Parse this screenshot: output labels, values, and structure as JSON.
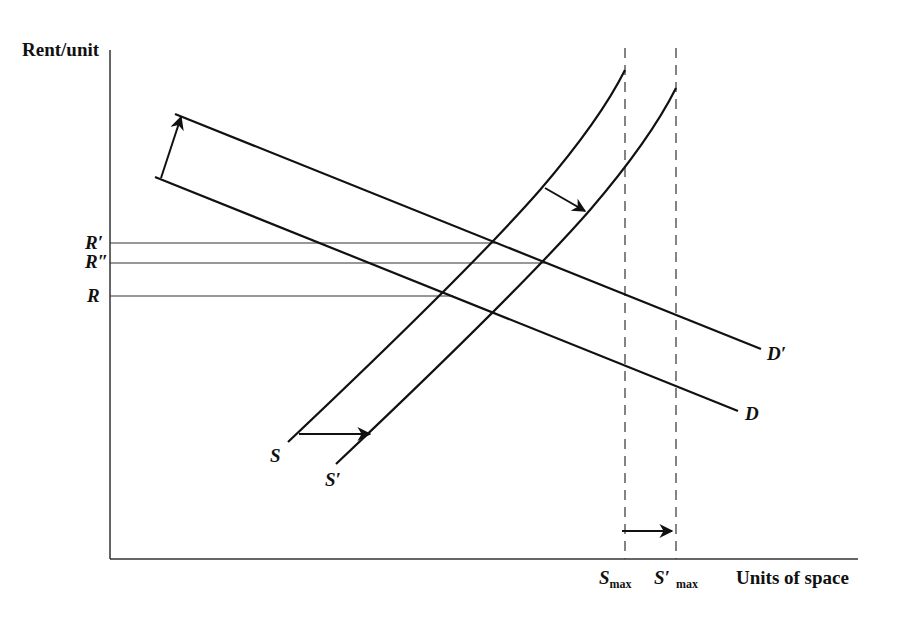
{
  "diagram": {
    "title": "",
    "y_axis_label": "Rent/unit",
    "x_axis_label": "Units of space",
    "rent_levels": [
      {
        "label": "R′",
        "y": 243,
        "x_end": 498
      },
      {
        "label": "R″",
        "y": 263,
        "x_end": 546
      },
      {
        "label": "R",
        "y": 296,
        "x_end": 453
      }
    ],
    "curves": {
      "S": {
        "label": "S"
      },
      "S_prime": {
        "label": "S′"
      },
      "D": {
        "label": "D"
      },
      "D_prime": {
        "label": "D′"
      }
    },
    "capacity": {
      "s_max": {
        "label_main": "S",
        "label_sub": "max"
      },
      "s_prime_max": {
        "label_main": "S′",
        "label_sub": "max"
      }
    },
    "colors": {
      "line": "#111111",
      "background": "#ffffff"
    }
  }
}
